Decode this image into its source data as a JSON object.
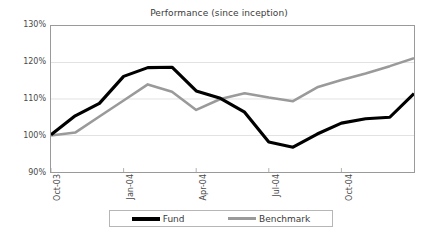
{
  "chart_data": {
    "type": "line",
    "title": "Performance (since inception)",
    "xlabel": "",
    "ylabel": "",
    "ylim": [
      90,
      130
    ],
    "ytick_labels": [
      "130%",
      "120%",
      "110%",
      "100%",
      "90%"
    ],
    "ytick_values": [
      130,
      120,
      110,
      100,
      90
    ],
    "grid": true,
    "legend_position": "bottom",
    "x": [
      "Oct-03",
      "Nov-03",
      "Dec-03",
      "Jan-04",
      "Feb-04",
      "Mar-04",
      "Apr-04",
      "May-04",
      "Jun-04",
      "Jul-04",
      "Aug-04",
      "Sep-04",
      "Oct-04",
      "Nov-04",
      "Dec-04",
      "Jan-05"
    ],
    "xtick_labels": [
      "Oct-03",
      "Jan-04",
      "Apr-04",
      "Jul-04",
      "Oct-04"
    ],
    "xtick_indices": [
      0,
      3,
      6,
      9,
      12
    ],
    "series": [
      {
        "name": "Fund",
        "color": "#000000",
        "width": 3.2,
        "values": [
          100.2,
          105.4,
          108.8,
          116.2,
          118.6,
          118.7,
          112.2,
          110.2,
          106.4,
          98.2,
          96.8,
          100.4,
          103.4,
          104.6,
          105.0,
          111.5
        ]
      },
      {
        "name": "Benchmark",
        "color": "#9a9a9a",
        "width": 2.6,
        "values": [
          100.0,
          100.8,
          105.2,
          109.6,
          114.0,
          112.0,
          107.0,
          110.0,
          111.6,
          110.4,
          109.4,
          113.2,
          115.2,
          117.0,
          119.0,
          121.2
        ]
      }
    ]
  },
  "legend": {
    "entries": [
      {
        "label": "Fund",
        "key": "fund"
      },
      {
        "label": "Benchmark",
        "key": "benchmark"
      }
    ]
  }
}
